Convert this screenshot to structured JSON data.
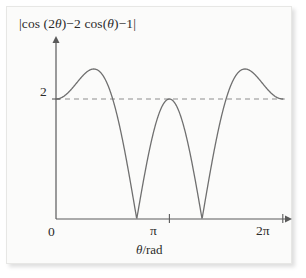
{
  "figure": {
    "background_color": "#fbfbfa",
    "frame_color": "#e7e7e5",
    "curve_color": "#6f6f6f",
    "axis_color": "#5a5a5a",
    "dash_color": "#8d8d8d",
    "text_color": "#2b2b2b"
  },
  "labels": {
    "y_axis_expression_full": "|cos (2θ)−2 cos(θ)−1|",
    "y_axis_part_1": "|cos (2",
    "y_axis_theta_1": "θ",
    "y_axis_part_2": ")−2 cos(",
    "y_axis_theta_2": "θ",
    "y_axis_part_3": ")−1|",
    "x_axis_name_theta": "θ",
    "x_axis_name_unit": "/rad",
    "x_axis_name_full": "θ/rad",
    "ytick_2": "2",
    "xtick_0": "0",
    "xtick_pi": "π",
    "xtick_2pi": "2π"
  },
  "chart_data": {
    "type": "line",
    "title": "",
    "subtitle": "",
    "xlabel": "θ/rad",
    "ylabel": "|cos (2θ)−2 cos(θ)−1|",
    "function": "|cos(2*theta) - 2*cos(theta) - 1|",
    "xlim": [
      0,
      6.283185307179586
    ],
    "ylim": [
      0,
      2.95
    ],
    "grid": false,
    "legend": null,
    "legend_position": "none",
    "xticks": [
      0,
      3.141592653589793,
      6.283185307179586
    ],
    "xticklabels": [
      "0",
      "π",
      "2π"
    ],
    "yticks": [
      2
    ],
    "yticklabels": [
      "2"
    ],
    "annotations": [
      {
        "type": "hline",
        "y": 2,
        "style": "dashed",
        "label": "y = 2",
        "x_start": 0,
        "x_end": 6.283185307179586
      }
    ],
    "key_points": [
      {
        "x": 0.0,
        "y": 2.0,
        "note": "start value at theta=0"
      },
      {
        "x": 1.231,
        "y": 2.5,
        "note": "local maximum"
      },
      {
        "x": 2.0944,
        "y": 2.0,
        "note": "crosses dashed line y=2"
      },
      {
        "x": 2.4189,
        "y": 0.0,
        "note": "zero (cusp)"
      },
      {
        "x": 3.1416,
        "y": 2.0,
        "note": "local maximum touching y=2 at theta=pi"
      },
      {
        "x": 3.8643,
        "y": 0.0,
        "note": "zero (cusp)"
      },
      {
        "x": 4.1888,
        "y": 2.0,
        "note": "crosses dashed line y=2"
      },
      {
        "x": 5.0522,
        "y": 2.5,
        "note": "local maximum"
      },
      {
        "x": 6.2832,
        "y": 2.0,
        "note": "end value at theta=2pi"
      }
    ],
    "series": [
      {
        "name": "|cos(2θ)−2cos(θ)−1|",
        "color": "#6f6f6f",
        "x": [
          0.0,
          0.1257,
          0.2513,
          0.377,
          0.5027,
          0.6283,
          0.754,
          0.8796,
          1.0053,
          1.131,
          1.2566,
          1.3823,
          1.508,
          1.6336,
          1.7593,
          1.885,
          2.0106,
          2.1363,
          2.2619,
          2.3876,
          2.5133,
          2.6389,
          2.7646,
          2.8903,
          3.0159,
          3.1416,
          3.2673,
          3.3929,
          3.5186,
          3.6442,
          3.7699,
          3.8956,
          4.0212,
          4.1469,
          4.2726,
          4.3982,
          4.5239,
          4.6496,
          4.7752,
          4.9009,
          5.0265,
          5.1522,
          5.2779,
          5.4035,
          5.5292,
          5.6549,
          5.7805,
          5.9062,
          6.0319,
          6.1575,
          6.2832
        ],
        "y": [
          2.0,
          2.0156,
          2.0604,
          2.1301,
          2.2183,
          2.3168,
          2.4164,
          2.5073,
          2.5799,
          2.6256,
          2.6374,
          2.6107,
          2.5435,
          2.4368,
          2.2947,
          2.1241,
          1.9345,
          1.7374,
          1.5455,
          1.3718,
          1.2288,
          1.1264,
          1.0708,
          1.0625,
          1.0961,
          1.1601,
          1.0961,
          1.0625,
          1.0708,
          1.1264,
          1.2288,
          1.3718,
          1.5455,
          1.7374,
          1.9345,
          2.1241,
          2.2947,
          2.4368,
          2.5435,
          2.6107,
          2.6374,
          2.6256,
          2.5799,
          2.5073,
          2.4164,
          2.3168,
          2.2183,
          2.1301,
          2.0604,
          2.0156,
          2.0
        ]
      }
    ]
  }
}
